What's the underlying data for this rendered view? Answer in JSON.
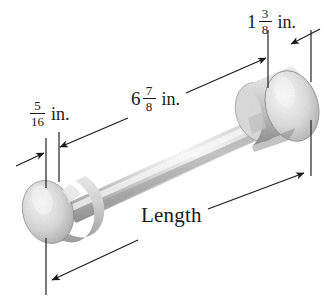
{
  "figure": {
    "kind": "engineering-pictorial-dimension-drawing",
    "object": "dumbbell-shaped shaft with a small disc cap on the left end and a larger cylindrical flange on the right end",
    "background_color": "#ffffff",
    "line_color": "#1a1a1a",
    "part_light": "#f2f2f2",
    "part_mid": "#cfcfcf",
    "part_dark": "#9a9a9a"
  },
  "labels": {
    "right_flange": {
      "name": "right-flange-width",
      "whole": "1",
      "numerator": "3",
      "denominator": "8",
      "unit": "in.",
      "full_text": "1 3/8 in."
    },
    "shaft": {
      "name": "shaft-length",
      "whole": "6",
      "numerator": "7",
      "denominator": "8",
      "unit": "in.",
      "full_text": "6 7/8 in."
    },
    "left_cap": {
      "name": "left-cap-width",
      "whole": "",
      "numerator": "5",
      "denominator": "16",
      "unit": "in.",
      "full_text": "5/16 in."
    },
    "overall": {
      "name": "overall-length",
      "text": "Length"
    }
  }
}
